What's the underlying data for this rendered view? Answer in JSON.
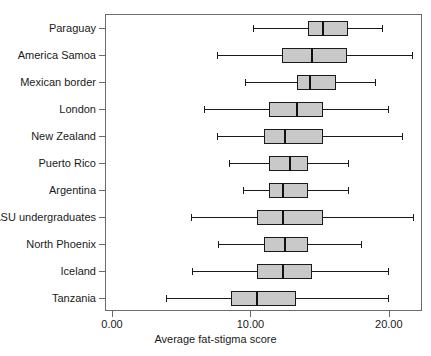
{
  "chart_data": {
    "type": "box",
    "title": "",
    "xlabel": "Average fat-stigma score",
    "ylabel": "",
    "xlim": [
      0.0,
      22.9
    ],
    "grid": false,
    "legend": null,
    "orientation": "horizontal",
    "xticks": [
      {
        "value": 0.0,
        "label": "0.00"
      },
      {
        "value": 10.0,
        "label": "10.00"
      },
      {
        "value": 20.0,
        "label": "20.00"
      }
    ],
    "categories": [
      "Paraguay",
      "America Samoa",
      "Mexican  border",
      "London",
      "New Zealand",
      "Puerto Rico",
      "Argentina",
      "ASU undergraduates",
      "North Phoenix",
      "Iceland",
      "Tanzania"
    ],
    "boxes": [
      {
        "category": "Paraguay",
        "min": 10.1,
        "q1": 14.1,
        "median": 15.2,
        "q3": 17.0,
        "max": 19.4
      },
      {
        "category": "America Samoa",
        "min": 7.5,
        "q1": 12.2,
        "median": 14.4,
        "q3": 16.9,
        "max": 21.6
      },
      {
        "category": "Mexican  border",
        "min": 9.5,
        "q1": 13.3,
        "median": 14.2,
        "q3": 16.1,
        "max": 18.9
      },
      {
        "category": "London",
        "min": 6.6,
        "q1": 11.3,
        "median": 13.3,
        "q3": 15.2,
        "max": 19.9
      },
      {
        "category": "New Zealand",
        "min": 7.5,
        "q1": 10.9,
        "median": 12.4,
        "q3": 15.2,
        "max": 20.9
      },
      {
        "category": "Puerto Rico",
        "min": 8.4,
        "q1": 11.3,
        "median": 12.8,
        "q3": 14.1,
        "max": 17.0
      },
      {
        "category": "Argentina",
        "min": 9.4,
        "q1": 11.3,
        "median": 12.3,
        "q3": 14.1,
        "max": 17.0
      },
      {
        "category": "ASU undergraduates",
        "min": 5.6,
        "q1": 10.4,
        "median": 12.3,
        "q3": 15.2,
        "max": 21.7
      },
      {
        "category": "North Phoenix",
        "min": 7.6,
        "q1": 10.9,
        "median": 12.4,
        "q3": 14.1,
        "max": 17.9
      },
      {
        "category": "Iceland",
        "min": 5.7,
        "q1": 10.4,
        "median": 12.3,
        "q3": 14.4,
        "max": 19.9
      },
      {
        "category": "Tanzania",
        "min": 3.8,
        "q1": 8.5,
        "median": 10.4,
        "q3": 13.2,
        "max": 19.9
      }
    ],
    "colors": {
      "box_fill": "#c9c9c9",
      "box_stroke": "#1a1a1a",
      "median": "#111111",
      "whisker": "#1a1a1a",
      "frame": "#6b6b6b",
      "background": "#ffffff",
      "text": "#1a1a1a"
    }
  }
}
